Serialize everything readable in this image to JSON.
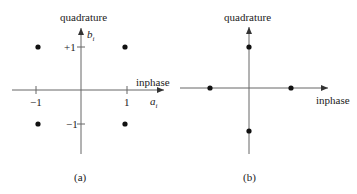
{
  "panels": [
    {
      "id": "a",
      "caption": "(a)",
      "y_axis_label": "quadrature",
      "x_axis_label": "inphase",
      "y_var": "b",
      "y_var_sub": "i",
      "x_var": "a",
      "x_var_sub": "i",
      "ticks": {
        "x_neg": "−1",
        "x_pos": "1",
        "y_pos": "+1",
        "y_neg": "−1"
      },
      "points": [
        [
          -1,
          1
        ],
        [
          1,
          1
        ],
        [
          -1,
          -1
        ],
        [
          1,
          -1
        ]
      ]
    },
    {
      "id": "b",
      "caption": "(b)",
      "y_axis_label": "quadrature",
      "x_axis_label": "inphase",
      "points": [
        [
          0,
          1
        ],
        [
          -1,
          0
        ],
        [
          1,
          0
        ],
        [
          0,
          -1
        ]
      ]
    }
  ],
  "colors": {
    "axis": "#555555",
    "point": "#111111",
    "text": "#222222"
  }
}
